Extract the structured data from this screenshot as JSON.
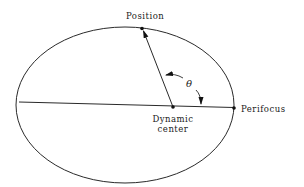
{
  "diagram": {
    "type": "orbit-ellipse",
    "labels": {
      "position": "Position",
      "perifocus": "Perifocus",
      "dynamic_center_line1": "Dynamic",
      "dynamic_center_line2": "center",
      "angle": "θ"
    },
    "colors": {
      "line": "#2a2a2a",
      "background": "#ffffff",
      "text": "#1a1a1a"
    }
  }
}
